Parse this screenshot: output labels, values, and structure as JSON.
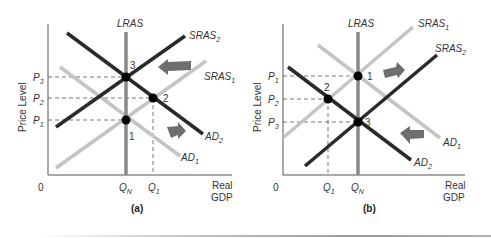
{
  "figure": {
    "colors": {
      "dark_line": "#2a2a2a",
      "light_line": "#c4c4c4",
      "lras_line": "#8a8a8a",
      "arrow": "#6e6e6e",
      "axis": "#555555",
      "dashed": "#555555",
      "point": "#000000"
    },
    "panels": [
      {
        "caption": "(a)",
        "y_axis_label": "Price Level",
        "x_axis_label_line1": "Real",
        "x_axis_label_line2": "GDP",
        "origin_label": "0",
        "lras_label": "LRAS",
        "price_labels": [
          {
            "base": "P",
            "sub": "3"
          },
          {
            "base": "P",
            "sub": "2"
          },
          {
            "base": "P",
            "sub": "1"
          }
        ],
        "quantity_labels": [
          {
            "base": "Q",
            "sub": "N"
          },
          {
            "base": "Q",
            "sub": "1"
          }
        ],
        "curves": [
          {
            "base": "SRAS",
            "sub": "2"
          },
          {
            "base": "SRAS",
            "sub": "1"
          },
          {
            "base": "AD",
            "sub": "2"
          },
          {
            "base": "AD",
            "sub": "1"
          }
        ],
        "points": [
          "3",
          "2",
          "1"
        ],
        "arrows": [
          "left-arrow (SRAS shifts left)",
          "right-arrow (AD shifts right)"
        ]
      },
      {
        "caption": "(b)",
        "y_axis_label": "Price Level",
        "x_axis_label_line1": "Real",
        "x_axis_label_line2": "GDP",
        "origin_label": "0",
        "lras_label": "LRAS",
        "price_labels": [
          {
            "base": "P",
            "sub": "1"
          },
          {
            "base": "P",
            "sub": "2"
          },
          {
            "base": "P",
            "sub": "3"
          }
        ],
        "quantity_labels": [
          {
            "base": "Q",
            "sub": "1"
          },
          {
            "base": "Q",
            "sub": "N"
          }
        ],
        "curves": [
          {
            "base": "SRAS",
            "sub": "1"
          },
          {
            "base": "SRAS",
            "sub": "2"
          },
          {
            "base": "AD",
            "sub": "1"
          },
          {
            "base": "AD",
            "sub": "2"
          }
        ],
        "points": [
          "1",
          "2",
          "3"
        ],
        "arrows": [
          "right-arrow (SRAS shifts right)",
          "left-arrow (AD shifts left)"
        ]
      }
    ]
  }
}
